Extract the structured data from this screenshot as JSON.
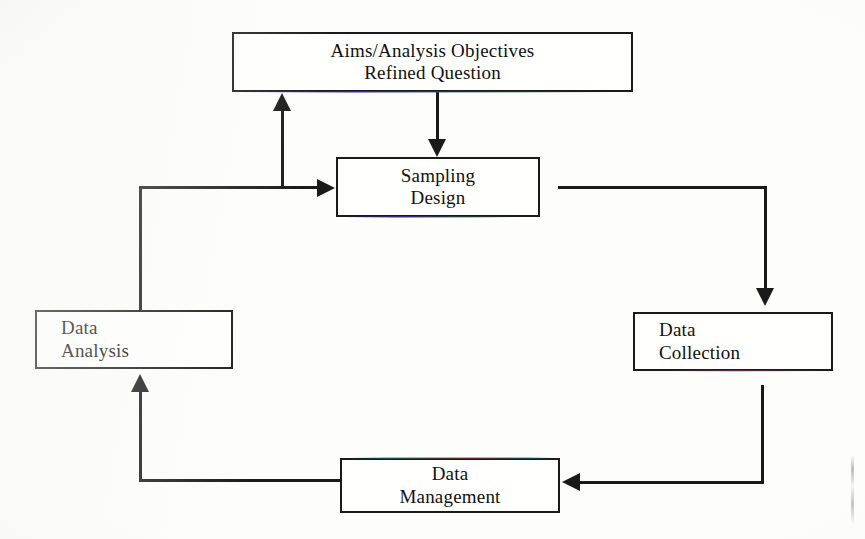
{
  "diagram": {
    "background_color": "#fdfdfb",
    "line_color": "#1a1a1a",
    "nodes": [
      {
        "id": "aims",
        "lines": [
          "Aims/Analysis Objectives",
          "Refined Question"
        ],
        "line1": "Aims/Analysis Objectives",
        "line2": "Refined Question",
        "x": 232,
        "y": 32,
        "w": 401,
        "h": 60,
        "align": "center"
      },
      {
        "id": "sampling-design",
        "lines": [
          "Sampling",
          "Design"
        ],
        "line1": "Sampling",
        "line2": "Design",
        "x": 336,
        "y": 157,
        "w": 204,
        "h": 60,
        "align": "center"
      },
      {
        "id": "data-collection",
        "lines": [
          "Data",
          "Collection"
        ],
        "line1": "Data",
        "line2": "Collection",
        "x": 633,
        "y": 312,
        "w": 200,
        "h": 59,
        "align": "left"
      },
      {
        "id": "data-management",
        "lines": [
          "Data",
          "Management"
        ],
        "line1": "Data",
        "line2": "Management",
        "x": 340,
        "y": 458,
        "w": 220,
        "h": 55,
        "align": "center"
      },
      {
        "id": "data-analysis",
        "lines": [
          "Data",
          "Analysis"
        ],
        "line1": "Data",
        "line2": "Analysis",
        "x": 35,
        "y": 310,
        "w": 198,
        "h": 59,
        "align": "left"
      }
    ],
    "edges": [
      {
        "from": "aims",
        "to": "sampling-design",
        "direction": "down"
      },
      {
        "from": "sampling-design",
        "to": "data-collection",
        "direction": "right-then-down"
      },
      {
        "from": "data-collection",
        "to": "data-management",
        "direction": "down-then-left"
      },
      {
        "from": "data-management",
        "to": "data-analysis",
        "direction": "left-then-up"
      },
      {
        "from": "data-analysis",
        "to": "sampling-design",
        "direction": "up-then-right"
      },
      {
        "from": "data-analysis",
        "to": "aims",
        "direction": "branch-up"
      }
    ]
  }
}
